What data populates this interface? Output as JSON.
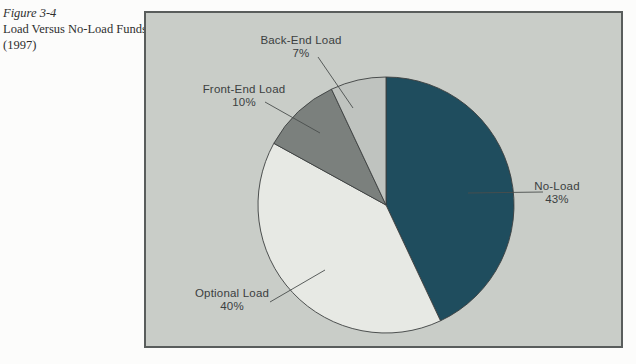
{
  "figure": {
    "number": "Figure 3-4",
    "title": "Load Versus No-Load Funds",
    "year": "(1997)"
  },
  "chart_data": {
    "type": "pie",
    "title": "Load Versus No-Load Funds (1997)",
    "labels": [
      "No-Load",
      "Optional Load",
      "Front-End Load",
      "Back-End Load"
    ],
    "values": [
      43,
      40,
      10,
      7
    ],
    "value_labels": [
      "43%",
      "40%",
      "10%",
      "7%"
    ],
    "unit": "%",
    "start_angle_deg": 0,
    "direction": "clockwise",
    "colors": [
      "#1f4d5e",
      "#e7e9e4",
      "#7b807d",
      "#bfc3bf"
    ],
    "outline_color": "#3c403f",
    "background_color": "#c9cdc8",
    "legend": "none",
    "label_style": "external-with-leader-lines"
  },
  "colors": {
    "page_background": "#fcfcfb",
    "box_border": "#595d5c",
    "label_text": "#3b403f",
    "caption_text": "#2e2e2e"
  }
}
